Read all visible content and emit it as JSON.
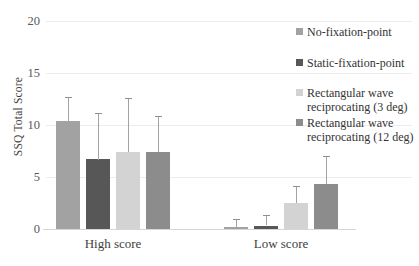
{
  "chart_data": {
    "type": "bar",
    "title": "",
    "xlabel": "",
    "ylabel": "SSQ Total Score",
    "categories": [
      "High score",
      "Low score"
    ],
    "ylim": [
      0,
      20
    ],
    "yticks": [
      0,
      5,
      10,
      15,
      20
    ],
    "grid": "horizontal",
    "legend_position": "right",
    "error_bars": "upper-only whiskers with caps",
    "series": [
      {
        "name": "No-fixation-point",
        "color": "#a2a2a2",
        "values": [
          10.4,
          0.2
        ],
        "errors_up": [
          2.3,
          0.8
        ]
      },
      {
        "name": "Static-fixation-point",
        "color": "#575757",
        "values": [
          6.7,
          0.3
        ],
        "errors_up": [
          4.5,
          1.0
        ]
      },
      {
        "name": "Rectangular wave reciprocating (3 deg)",
        "color": "#d3d3d3",
        "values": [
          7.4,
          2.5
        ],
        "errors_up": [
          5.2,
          1.6
        ]
      },
      {
        "name": "Rectangular wave reciprocating (12 deg)",
        "color": "#8c8c8c",
        "values": [
          7.4,
          4.3
        ],
        "errors_up": [
          3.5,
          2.7
        ]
      }
    ]
  }
}
